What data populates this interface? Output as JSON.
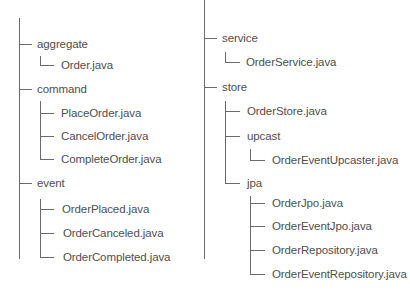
{
  "tree": {
    "left": {
      "groups": [
        {
          "label": "aggregate",
          "children": [
            "Order.java"
          ]
        },
        {
          "label": "command",
          "children": [
            "PlaceOrder.java",
            "CancelOrder.java",
            "CompleteOrder.java"
          ]
        },
        {
          "label": "event",
          "children": [
            "OrderPlaced.java",
            "OrderCanceled.java",
            "OrderCompleted.java"
          ]
        }
      ]
    },
    "right": {
      "groups": [
        {
          "label": "service",
          "children": [
            "OrderService.java"
          ]
        },
        {
          "label": "store",
          "children": [
            "OrderStore.java"
          ],
          "subgroups": [
            {
              "label": "upcast",
              "children": [
                "OrderEventUpcaster.java"
              ]
            },
            {
              "label": "jpa",
              "children": [
                "OrderJpo.java",
                "OrderEventJpo.java",
                "OrderRepository.java",
                "OrderEventRepository.java"
              ]
            }
          ]
        }
      ]
    }
  },
  "colors": {
    "line": "#6a6a6a",
    "text": "#4e4e4e",
    "background": "#ffffff"
  }
}
